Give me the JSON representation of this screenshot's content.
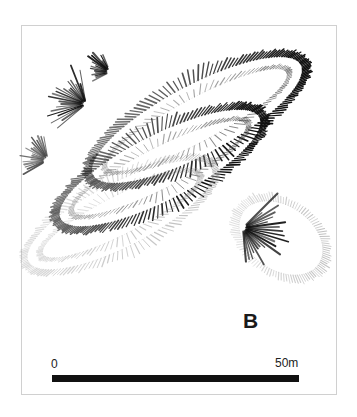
{
  "figure": {
    "site_label": "B",
    "scale": {
      "min_label": "0",
      "max_label": "50m",
      "bar_length_px": 247,
      "represents_metres": 50
    },
    "style": {
      "background": "#ffffff",
      "frame_border": "#d0d0d0",
      "ink_dark": "#111111",
      "ink_mid": "#4a4a4a",
      "ink_light": "#8a8a8a"
    }
  },
  "plan_data": {
    "type": "archaeological-hachure-plan",
    "description": "Earthwork survey plan of overlapping elongated oval enclosures drawn with hachure tick marks",
    "features": [
      {
        "id": "enclosure-north",
        "name": "northern long enclosure",
        "shape": "elongated oval",
        "orientation_deg": -28,
        "tone": "dark",
        "hachure_density": "high",
        "cx": 197,
        "cy": 120,
        "rx": 118,
        "ry": 35
      },
      {
        "id": "enclosure-central",
        "name": "central long enclosure",
        "shape": "elongated oval",
        "orientation_deg": -27,
        "tone": "dark",
        "hachure_density": "high",
        "cx": 160,
        "cy": 168,
        "rx": 112,
        "ry": 33
      },
      {
        "id": "enclosure-south",
        "name": "southern long enclosure",
        "shape": "elongated oval",
        "orientation_deg": -27,
        "tone": "light",
        "hachure_density": "medium",
        "cx": 120,
        "cy": 215,
        "rx": 103,
        "ry": 32
      },
      {
        "id": "enclosure-east-annex",
        "name": "eastern small oval annex",
        "shape": "oval",
        "orientation_deg": -55,
        "tone": "light",
        "hachure_density": "low",
        "cx": 281,
        "cy": 238,
        "rx": 32,
        "ry": 46
      }
    ],
    "terminal_fans": [
      {
        "id": "fan-west-central",
        "cx": 86,
        "cy": 104,
        "direction_deg": 200,
        "spread_deg": 120,
        "rays": 22,
        "length": 30,
        "tone": "dark"
      },
      {
        "id": "fan-west-north",
        "cx": 110,
        "cy": 72,
        "direction_deg": 200,
        "spread_deg": 95,
        "rays": 16,
        "length": 17,
        "tone": "dark"
      },
      {
        "id": "fan-west-south",
        "cx": 48,
        "cy": 160,
        "direction_deg": 205,
        "spread_deg": 110,
        "rays": 18,
        "length": 18,
        "tone": "mid"
      },
      {
        "id": "fan-east-central",
        "cx": 243,
        "cy": 228,
        "direction_deg": 20,
        "spread_deg": 130,
        "rays": 22,
        "length": 34,
        "tone": "dark"
      }
    ]
  }
}
